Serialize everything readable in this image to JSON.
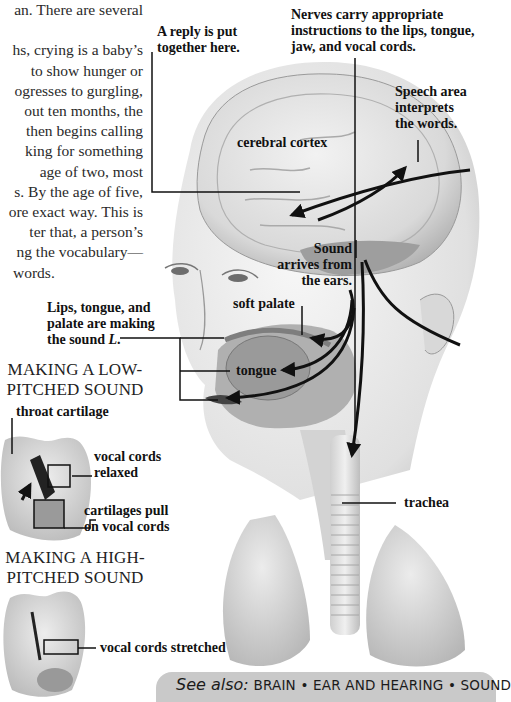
{
  "body_text": {
    "lines": [
      "an. There are several",
      "k.",
      "hs, crying is a baby’s",
      "to show hunger or",
      "ogresses to gurgling,",
      "out ten months, the",
      "then begins calling",
      "king for something",
      "age of two, most",
      "s. By the age of five,",
      "ore exact way. This is",
      "ter that, a person’s",
      "ng the vocabulary—",
      "words."
    ]
  },
  "labels": {
    "reply": [
      "A reply is put",
      "together here."
    ],
    "nerves": [
      "Nerves carry appropriate",
      "instructions to the lips, tongue,",
      "jaw, and vocal cords."
    ],
    "speech_area": [
      "Speech area",
      "interprets",
      "the words."
    ],
    "cerebral_cortex": "cerebral cortex",
    "sound_arrives": [
      "Sound",
      "arrives from",
      "the ears."
    ],
    "soft_palate": "soft palate",
    "lips_tongue": [
      "Lips, tongue, and",
      "palate are making",
      "the sound "
    ],
    "lips_tongue_italic": "L",
    "lips_tongue_end": ".",
    "tongue": "tongue",
    "trachea": "trachea",
    "throat_cartilage": "throat cartilage",
    "vocal_cords_relaxed": [
      "vocal cords",
      "relaxed"
    ],
    "cartilages_pull": [
      "cartilages pull",
      "on vocal cords"
    ],
    "vocal_cords_stretched": "vocal cords stretched"
  },
  "captions": {
    "low": [
      "MAKING A LOW-",
      "PITCHED SOUND"
    ],
    "high": [
      "MAKING A HIGH-",
      "PITCHED SOUND"
    ]
  },
  "see_also": {
    "prefix": "See also:",
    "links": [
      "BRAIN",
      "EAR AND HEARING",
      "SOUND"
    ],
    "separator": "•",
    "band_color": "#c9c9c9"
  }
}
